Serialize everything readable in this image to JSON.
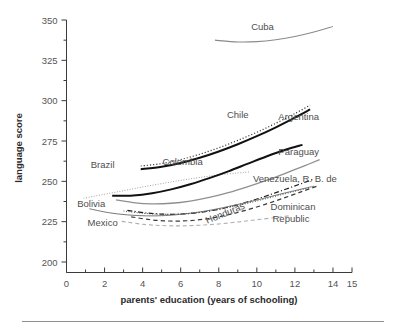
{
  "chart_data": {
    "type": "line",
    "title": "",
    "xlabel": "parents' education (years of schooling)",
    "ylabel": "language score",
    "xlim": [
      0,
      15
    ],
    "ylim": [
      200,
      350
    ],
    "x_ticks": [
      0,
      2,
      4,
      6,
      8,
      10,
      12,
      14,
      15
    ],
    "x_tick_labels": [
      "0",
      "2",
      "4",
      "6",
      "8",
      "10",
      "12",
      "14",
      "15"
    ],
    "x_minor_ticks": [
      1,
      3,
      5,
      7,
      9,
      11,
      13
    ],
    "y_ticks": [
      200,
      225,
      250,
      275,
      300,
      325,
      350
    ],
    "y_tick_labels": [
      "200",
      "225",
      "250",
      "275",
      "300",
      "325",
      "350"
    ],
    "y_minor_ticks": [
      212.5,
      237.5,
      262.5,
      287.5,
      312.5,
      337.5
    ],
    "grid": false,
    "legend": "inline-labels",
    "series": [
      {
        "name": "Cuba",
        "label": "Cuba",
        "style": "solid",
        "color": "#8a8a8a",
        "width": 1.1,
        "label_x": 10.3,
        "label_y": 343.5,
        "points": [
          {
            "x": 7.8,
            "y": 337.5
          },
          {
            "x": 9.0,
            "y": 336.4
          },
          {
            "x": 10.0,
            "y": 336.6
          },
          {
            "x": 11.0,
            "y": 337.8
          },
          {
            "x": 12.0,
            "y": 339.8
          },
          {
            "x": 13.0,
            "y": 342.6
          },
          {
            "x": 14.0,
            "y": 346.0
          }
        ]
      },
      {
        "name": "Argentina",
        "label": "Argentina",
        "style": "dotted",
        "color": "#2e2e2e",
        "width": 1.2,
        "label_x": 12.2,
        "label_y": 288.0,
        "points": [
          {
            "x": 3.9,
            "y": 259.5
          },
          {
            "x": 5.0,
            "y": 261.0
          },
          {
            "x": 6.0,
            "y": 263.5
          },
          {
            "x": 7.0,
            "y": 266.8
          },
          {
            "x": 8.0,
            "y": 270.8
          },
          {
            "x": 9.0,
            "y": 275.4
          },
          {
            "x": 10.0,
            "y": 280.4
          },
          {
            "x": 11.0,
            "y": 286.0
          },
          {
            "x": 12.0,
            "y": 292.0
          },
          {
            "x": 12.8,
            "y": 297.2
          }
        ]
      },
      {
        "name": "Chile",
        "label": "Chile",
        "style": "solid",
        "color": "#111111",
        "width": 2.0,
        "label_x": 9.0,
        "label_y": 289.5,
        "points": [
          {
            "x": 3.9,
            "y": 257.5
          },
          {
            "x": 5.0,
            "y": 259.0
          },
          {
            "x": 6.0,
            "y": 261.4
          },
          {
            "x": 7.0,
            "y": 264.6
          },
          {
            "x": 8.0,
            "y": 268.5
          },
          {
            "x": 9.0,
            "y": 273.0
          },
          {
            "x": 10.0,
            "y": 278.0
          },
          {
            "x": 11.0,
            "y": 283.5
          },
          {
            "x": 12.0,
            "y": 289.5
          },
          {
            "x": 12.8,
            "y": 294.6
          }
        ]
      },
      {
        "name": "Brazil",
        "label": "Brazil",
        "style": "dotted",
        "color": "#9a9a9a",
        "width": 1.0,
        "label_x": 1.9,
        "label_y": 258.5,
        "points": [
          {
            "x": 0.9,
            "y": 239.5
          },
          {
            "x": 2.0,
            "y": 242.0
          },
          {
            "x": 3.0,
            "y": 244.2
          },
          {
            "x": 4.0,
            "y": 246.5
          },
          {
            "x": 5.0,
            "y": 248.6
          },
          {
            "x": 6.0,
            "y": 250.6
          },
          {
            "x": 7.0,
            "y": 252.4
          },
          {
            "x": 8.0,
            "y": 254.0
          },
          {
            "x": 9.0,
            "y": 255.2
          },
          {
            "x": 9.6,
            "y": 255.8
          }
        ]
      },
      {
        "name": "Colombia",
        "label": "Colombia",
        "style": "solid",
        "color": "#111111",
        "width": 2.0,
        "label_x": 6.1,
        "label_y": 260.0,
        "points": [
          {
            "x": 2.4,
            "y": 241.0
          },
          {
            "x": 3.5,
            "y": 241.2
          },
          {
            "x": 4.5,
            "y": 242.6
          },
          {
            "x": 5.5,
            "y": 245.0
          },
          {
            "x": 6.5,
            "y": 248.2
          },
          {
            "x": 7.5,
            "y": 252.0
          },
          {
            "x": 8.5,
            "y": 256.2
          },
          {
            "x": 9.5,
            "y": 260.8
          },
          {
            "x": 10.5,
            "y": 265.4
          },
          {
            "x": 11.5,
            "y": 269.6
          },
          {
            "x": 12.4,
            "y": 272.6
          }
        ]
      },
      {
        "name": "Paraguay",
        "label": "Paraguay",
        "style": "solid",
        "color": "#8f8f8f",
        "width": 1.3,
        "label_x": 12.2,
        "label_y": 266.5,
        "points": [
          {
            "x": 2.6,
            "y": 238.5
          },
          {
            "x": 3.5,
            "y": 236.8
          },
          {
            "x": 4.5,
            "y": 236.0
          },
          {
            "x": 5.5,
            "y": 236.4
          },
          {
            "x": 6.5,
            "y": 237.8
          },
          {
            "x": 7.5,
            "y": 240.0
          },
          {
            "x": 8.5,
            "y": 243.0
          },
          {
            "x": 9.5,
            "y": 246.6
          },
          {
            "x": 10.5,
            "y": 250.6
          },
          {
            "x": 11.5,
            "y": 255.0
          },
          {
            "x": 12.5,
            "y": 259.6
          },
          {
            "x": 13.3,
            "y": 263.4
          }
        ]
      },
      {
        "name": "Venezuela, R. B. de",
        "label": "Venezuela, R. B. de",
        "style": "dashdot",
        "color": "#1c1c1c",
        "width": 1.2,
        "label_x": 12.0,
        "label_y": 249.5,
        "points": [
          {
            "x": 3.2,
            "y": 232.0
          },
          {
            "x": 4.2,
            "y": 230.4
          },
          {
            "x": 5.2,
            "y": 229.6
          },
          {
            "x": 6.2,
            "y": 229.8
          },
          {
            "x": 7.2,
            "y": 231.0
          },
          {
            "x": 8.2,
            "y": 233.2
          },
          {
            "x": 9.2,
            "y": 236.2
          },
          {
            "x": 10.2,
            "y": 239.8
          },
          {
            "x": 11.2,
            "y": 243.8
          },
          {
            "x": 12.2,
            "y": 248.0
          },
          {
            "x": 13.0,
            "y": 251.4
          }
        ]
      },
      {
        "name": "Bolivia",
        "label": "Bolivia",
        "style": "solid",
        "color": "#777777",
        "width": 1.0,
        "label_x": 1.3,
        "label_y": 234.0,
        "points": [
          {
            "x": 1.2,
            "y": 233.0
          },
          {
            "x": 2.2,
            "y": 230.6
          },
          {
            "x": 3.2,
            "y": 229.2
          },
          {
            "x": 4.2,
            "y": 228.6
          },
          {
            "x": 5.2,
            "y": 228.8
          },
          {
            "x": 6.2,
            "y": 229.8
          },
          {
            "x": 7.2,
            "y": 231.4
          },
          {
            "x": 8.2,
            "y": 233.6
          },
          {
            "x": 9.2,
            "y": 236.2
          },
          {
            "x": 10.2,
            "y": 239.0
          },
          {
            "x": 11.2,
            "y": 242.0
          },
          {
            "x": 12.2,
            "y": 244.8
          },
          {
            "x": 13.0,
            "y": 247.0
          }
        ]
      },
      {
        "name": "Honduras",
        "label": "Honduras",
        "style": "dotted",
        "color": "#4a4a4a",
        "width": 1.0,
        "label_x": 8.4,
        "label_y": 228.5,
        "points": [
          {
            "x": 3.0,
            "y": 231.6
          },
          {
            "x": 4.0,
            "y": 230.2
          },
          {
            "x": 5.0,
            "y": 229.6
          },
          {
            "x": 6.0,
            "y": 229.8
          },
          {
            "x": 7.0,
            "y": 230.8
          },
          {
            "x": 8.0,
            "y": 232.6
          },
          {
            "x": 9.0,
            "y": 235.0
          },
          {
            "x": 10.0,
            "y": 237.8
          },
          {
            "x": 11.0,
            "y": 240.8
          },
          {
            "x": 12.0,
            "y": 243.8
          },
          {
            "x": 12.8,
            "y": 246.2
          }
        ]
      },
      {
        "name": "Mexico",
        "label": "Mexico",
        "style": "dashed",
        "color": "#3a3a3a",
        "width": 1.2,
        "label_x": 1.9,
        "label_y": 222.5,
        "points": [
          {
            "x": 3.4,
            "y": 228.0
          },
          {
            "x": 4.4,
            "y": 226.2
          },
          {
            "x": 5.4,
            "y": 225.4
          },
          {
            "x": 6.4,
            "y": 225.6
          },
          {
            "x": 7.4,
            "y": 226.8
          },
          {
            "x": 8.4,
            "y": 229.0
          },
          {
            "x": 9.4,
            "y": 232.0
          },
          {
            "x": 10.4,
            "y": 235.6
          },
          {
            "x": 11.4,
            "y": 239.6
          },
          {
            "x": 12.4,
            "y": 243.8
          },
          {
            "x": 13.2,
            "y": 247.2
          }
        ]
      },
      {
        "name": "Dominican Republic",
        "label": "Dominican",
        "label_line2": "Republic",
        "style": "dashed",
        "color": "#b0b0b0",
        "width": 1.1,
        "label_x": 11.9,
        "label_y": 232.0,
        "points": [
          {
            "x": 2.9,
            "y": 225.2
          },
          {
            "x": 4.0,
            "y": 223.4
          },
          {
            "x": 5.0,
            "y": 222.6
          },
          {
            "x": 6.0,
            "y": 222.4
          },
          {
            "x": 7.0,
            "y": 222.8
          },
          {
            "x": 8.0,
            "y": 223.6
          },
          {
            "x": 9.0,
            "y": 224.8
          },
          {
            "x": 10.0,
            "y": 226.2
          },
          {
            "x": 11.0,
            "y": 227.6
          },
          {
            "x": 11.8,
            "y": 228.8
          }
        ]
      }
    ]
  }
}
